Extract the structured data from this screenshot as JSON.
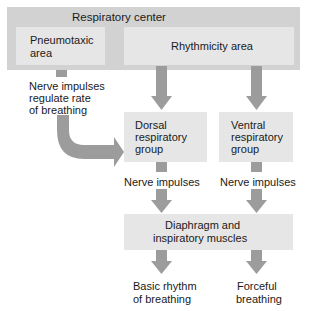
{
  "diagram": {
    "outer_box": {
      "label": "Respiratory center"
    },
    "pneumotaxic": {
      "line1": "Pneumotaxic",
      "line2": "area"
    },
    "rhythmicity": {
      "label": "Rhythmicity area"
    },
    "regulate_note": {
      "line1": "Nerve impulses",
      "line2": "regulate rate",
      "line3": "of breathing"
    },
    "dorsal": {
      "line1": "Dorsal",
      "line2": "respiratory",
      "line3": "group"
    },
    "ventral": {
      "line1": "Ventral",
      "line2": "respiratory",
      "line3": "group"
    },
    "nerve_left": "Nerve impulses",
    "nerve_right": "Nerve impulses",
    "diaphragm": {
      "line1": "Diaphragm and",
      "line2": "inspiratory muscles"
    },
    "basic": {
      "line1": "Basic rhythm",
      "line2": "of breathing"
    },
    "forceful": {
      "line1": "Forceful",
      "line2": "breathing"
    }
  },
  "colors": {
    "outer_fill": "#d2d2d2",
    "box_fill": "#e6e6e6",
    "arrow": "#9c9c9c",
    "text": "#1a1a1a"
  }
}
